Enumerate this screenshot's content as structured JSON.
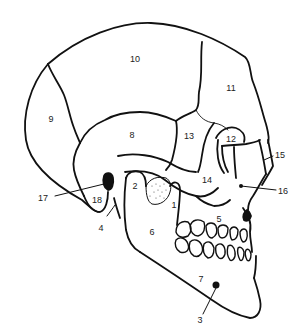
{
  "figure": {
    "stroke_color": "#111111",
    "fill_dark": "#111111",
    "labels": [
      {
        "id": "1",
        "text": "1",
        "x": 174,
        "y": 205
      },
      {
        "id": "2",
        "text": "2",
        "x": 135,
        "y": 186
      },
      {
        "id": "3",
        "text": "3",
        "x": 200,
        "y": 320
      },
      {
        "id": "4",
        "text": "4",
        "x": 101,
        "y": 228
      },
      {
        "id": "5",
        "text": "5",
        "x": 219,
        "y": 219
      },
      {
        "id": "6",
        "text": "6",
        "x": 152,
        "y": 232
      },
      {
        "id": "7",
        "text": "7",
        "x": 201,
        "y": 279
      },
      {
        "id": "8",
        "text": "8",
        "x": 132,
        "y": 135
      },
      {
        "id": "9",
        "text": "9",
        "x": 51,
        "y": 119
      },
      {
        "id": "10",
        "text": "10",
        "x": 135,
        "y": 59
      },
      {
        "id": "11",
        "text": "11",
        "x": 231,
        "y": 88
      },
      {
        "id": "12",
        "text": "12",
        "x": 231,
        "y": 139
      },
      {
        "id": "13",
        "text": "13",
        "x": 189,
        "y": 136
      },
      {
        "id": "14",
        "text": "14",
        "x": 207,
        "y": 180
      },
      {
        "id": "15",
        "text": "15",
        "x": 280,
        "y": 155
      },
      {
        "id": "16",
        "text": "16",
        "x": 283,
        "y": 191
      },
      {
        "id": "17",
        "text": "17",
        "x": 43,
        "y": 198
      },
      {
        "id": "18",
        "text": "18",
        "x": 97,
        "y": 200
      }
    ]
  }
}
